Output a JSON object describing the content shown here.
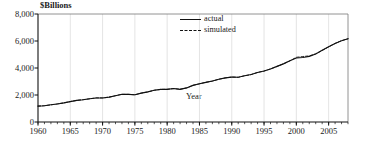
{
  "chart_data": {
    "type": "line",
    "title": "",
    "ylabel": "$Billions",
    "xlabel": "Year",
    "ylim": [
      0,
      8000
    ],
    "xlim": [
      1960,
      2008
    ],
    "grid": true,
    "legend_position": "top-center-right",
    "ytick_labels": [
      "8,000",
      "6,000",
      "4,000",
      "2,000",
      "0"
    ],
    "ytick_values": [
      8000,
      6000,
      4000,
      2000,
      0
    ],
    "xtick_labels": [
      "1960",
      "1965",
      "1970",
      "1975",
      "1980",
      "1985",
      "1990",
      "1995",
      "2000",
      "2005"
    ],
    "xtick_values": [
      1960,
      1965,
      1970,
      1975,
      1980,
      1985,
      1990,
      1995,
      2000,
      2005
    ],
    "x": [
      1960,
      1961,
      1962,
      1963,
      1964,
      1965,
      1966,
      1967,
      1968,
      1969,
      1970,
      1971,
      1972,
      1973,
      1974,
      1975,
      1976,
      1977,
      1978,
      1979,
      1980,
      1981,
      1982,
      1983,
      1984,
      1985,
      1986,
      1987,
      1988,
      1989,
      1990,
      1991,
      1992,
      1993,
      1994,
      1995,
      1996,
      1997,
      1998,
      1999,
      2000,
      2001,
      2002,
      2003,
      2004,
      2005,
      2006,
      2007,
      2008
    ],
    "series": [
      {
        "name": "actual",
        "style": "solid",
        "color": "#111111",
        "values": [
          1000,
          1020,
          1080,
          1130,
          1200,
          1280,
          1360,
          1400,
          1460,
          1510,
          1510,
          1560,
          1650,
          1740,
          1730,
          1710,
          1810,
          1890,
          1990,
          2050,
          2050,
          2100,
          2050,
          2140,
          2300,
          2400,
          2490,
          2570,
          2680,
          2770,
          2820,
          2810,
          2900,
          2980,
          3110,
          3200,
          3330,
          3490,
          3650,
          3840,
          4020,
          4050,
          4120,
          4270,
          4500,
          4720,
          4930,
          5100,
          5230
        ]
      },
      {
        "name": "simulated",
        "style": "dashed",
        "color": "#111111",
        "values": [
          1000,
          1025,
          1075,
          1140,
          1195,
          1285,
          1355,
          1405,
          1455,
          1515,
          1515,
          1555,
          1655,
          1735,
          1735,
          1705,
          1815,
          1885,
          1995,
          2045,
          2055,
          2095,
          2060,
          2135,
          2305,
          2395,
          2495,
          2565,
          2685,
          2765,
          2825,
          2805,
          2905,
          2975,
          3115,
          3195,
          3335,
          3485,
          3655,
          3835,
          4060,
          4110,
          4150,
          4280,
          4490,
          4715,
          4935,
          5105,
          5225
        ]
      }
    ],
    "note_scaling": "Plotted values are scaled ×1.18 onto the 0-8,000 axis as drawn."
  }
}
